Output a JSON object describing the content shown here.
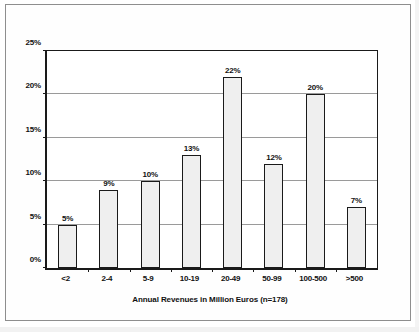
{
  "chart_data": {
    "type": "bar",
    "title": "",
    "subtitle": "",
    "categories": [
      "<2",
      "2-4",
      "5-9",
      "10-19",
      "20-49",
      "50-99",
      "100-500",
      ">500"
    ],
    "values": [
      5,
      9,
      10,
      13,
      22,
      12,
      20,
      7
    ],
    "data_labels": [
      "5%",
      "9%",
      "10%",
      "13%",
      "22%",
      "12%",
      "20%",
      "7%"
    ],
    "xlabel": "Annual Revenues in Million Euros (n=178)",
    "ylabel": "",
    "ylim": [
      0,
      25
    ],
    "ytick_values": [
      0,
      5,
      10,
      15,
      20,
      25
    ],
    "ytick_labels": [
      "0%",
      "5%",
      "10%",
      "15%",
      "20%",
      "25%"
    ],
    "grid": true,
    "grid_axis": "y",
    "legend": false,
    "legend_position": "none",
    "sample_size": "n=178",
    "bar_fill_color": "#efefef",
    "bar_border_color": "#1a1a1a",
    "gridline_color": "#9a9a9a",
    "axis_color": "#1a1a1a",
    "background_color": "#ffffff"
  }
}
